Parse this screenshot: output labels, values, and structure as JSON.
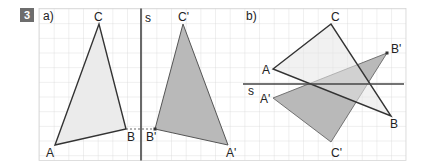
{
  "exercise": {
    "number": "3"
  },
  "parts": [
    {
      "label": "a)",
      "axis_label": "s",
      "original": {
        "points": {
          "A": "A",
          "B": "B",
          "C": "C"
        }
      },
      "image": {
        "points": {
          "A": "A'",
          "B": "B'",
          "C": "C'"
        }
      }
    },
    {
      "label": "b)",
      "axis_label": "s",
      "original": {
        "points": {
          "A": "A",
          "B": "B",
          "C": "C"
        }
      },
      "image": {
        "points": {
          "A": "A'",
          "B": "B'",
          "C": "C'"
        }
      }
    }
  ],
  "colors": {
    "grid": "#d6d6d6",
    "original_fill": "#ebebeb",
    "image_fill": "#b9b9b9",
    "stroke": "#333333",
    "axis": "#444444"
  }
}
